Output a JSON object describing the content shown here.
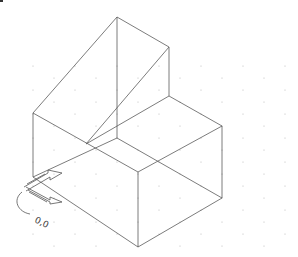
{
  "viewport": {
    "title": "Isometric drawing",
    "background": "#ffffff",
    "line_color": "#555555",
    "grid_dot_color": "#b0b0b0"
  },
  "ucs_icon": {
    "origin_label": "0,0",
    "description": "UCS origin icon with X/Y arrows"
  },
  "model": {
    "vertices": {
      "A": [
        117,
        17
      ],
      "B": [
        169,
        47
      ],
      "C": [
        169,
        96
      ],
      "D": [
        222,
        126
      ],
      "E": [
        222,
        198
      ],
      "F": [
        138,
        247
      ],
      "G": [
        33,
        113
      ],
      "H": [
        33,
        177
      ],
      "I": [
        138,
        172
      ],
      "J": [
        117,
        138
      ],
      "K": [
        86,
        144
      ]
    },
    "edges": [
      [
        "A",
        "B"
      ],
      [
        "A",
        "G"
      ],
      [
        "A",
        "J"
      ],
      [
        "B",
        "C"
      ],
      [
        "B",
        "K"
      ],
      [
        "C",
        "D"
      ],
      [
        "D",
        "E"
      ],
      [
        "E",
        "F"
      ],
      [
        "F",
        "H"
      ],
      [
        "H",
        "G"
      ],
      [
        "G",
        "I"
      ],
      [
        "I",
        "F"
      ],
      [
        "I",
        "D"
      ],
      [
        "J",
        "E"
      ],
      [
        "K",
        "C"
      ],
      [
        "J",
        "H"
      ]
    ]
  }
}
